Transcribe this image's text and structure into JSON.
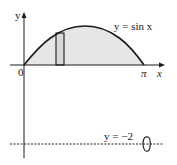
{
  "diagram": {
    "y_axis_label": "y",
    "x_axis_label": "x",
    "origin_label": "0",
    "pi_label": "π",
    "curve_label": "y = sin x",
    "line_label": "y = −2",
    "colors": {
      "stroke": "#1a1a1a",
      "fill": "#e6e6e6"
    }
  }
}
